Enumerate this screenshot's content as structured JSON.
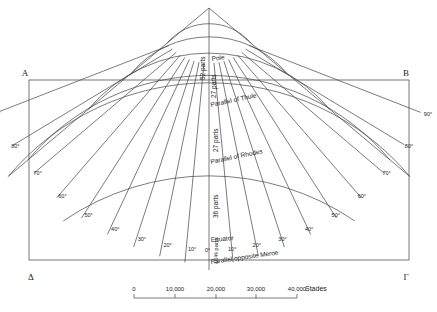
{
  "diagram": {
    "title": "",
    "corners": {
      "top_left": "A",
      "top_right": "B",
      "bottom_left": "Δ",
      "bottom_right": "Γ"
    },
    "parallels": [
      {
        "label": "Pole",
        "radius": 55
      },
      {
        "label": "Parallel of Thule",
        "radius": 101
      },
      {
        "label": "Parallel of Rhodes",
        "radius": 158
      },
      {
        "label": "Equator",
        "radius": 236
      },
      {
        "label": "Parallel opposite Meroe",
        "radius": 258
      }
    ],
    "central_meridian_labels": {
      "pole_to_thule": "52 parts",
      "thule_upper": "27 parts",
      "thule_to_rhodes": "27 parts",
      "rhodes_to_equator": "36 parts",
      "equator_to_meroe": "16⅜ parts"
    },
    "meridian_degree_labels": [
      "0°",
      "10°",
      "20°",
      "30°",
      "40°",
      "50°",
      "60°",
      "70°",
      "80°",
      "90°"
    ],
    "scale_bar": {
      "ticks": [
        "0",
        "10,000",
        "20,000",
        "30,000",
        "40,000"
      ],
      "unit": "Stades"
    }
  }
}
